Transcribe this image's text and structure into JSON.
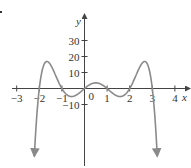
{
  "chart_data": {
    "type": "line",
    "title": "",
    "xlabel": "x",
    "ylabel": "y",
    "xlim": [
      -3.2,
      4.6
    ],
    "ylim": [
      -45,
      44
    ],
    "x_ticks": [
      -3,
      -2,
      -1,
      1,
      2,
      3,
      4
    ],
    "x_tick_labels": [
      "−3",
      "−2",
      "−1",
      "1",
      "2",
      "3",
      "4"
    ],
    "y_ticks": [
      30,
      20,
      10,
      -10
    ],
    "y_tick_labels": [
      "30",
      "20",
      "10",
      "−10"
    ],
    "origin_label": "0",
    "grid": false,
    "legend": null,
    "function": "y = -x(x+2)(x+1)(x-1)(x-2)(x-3)",
    "roots": [
      -2,
      -1,
      0,
      1,
      2,
      3
    ],
    "key_points": [
      {
        "x": -1.7,
        "y": 17
      },
      {
        "x": -0.45,
        "y": -5
      },
      {
        "x": 0.5,
        "y": 3.5
      },
      {
        "x": 1.45,
        "y": -5
      },
      {
        "x": 2.7,
        "y": 17
      }
    ],
    "ends": "both ends go to -infinity (arrows pointing down)",
    "series": [
      {
        "name": "f(x)",
        "color": "#8a8a8a",
        "x_range": [
          -2.28,
          3.28
        ]
      }
    ]
  }
}
